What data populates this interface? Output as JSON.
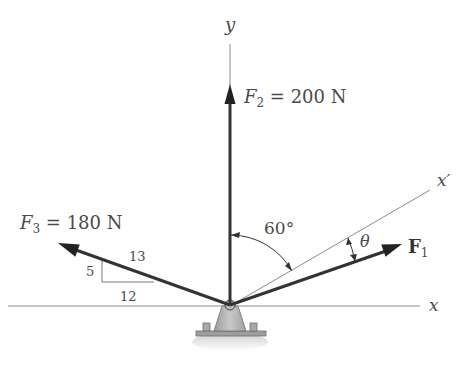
{
  "diagram": {
    "axes": {
      "y_label": "y",
      "x_label": "x",
      "x_prime_label": "x′"
    },
    "forces": [
      {
        "id": "F1",
        "symbol": "F",
        "subscript": "1",
        "label_suffix": "",
        "magnitude": "",
        "direction": "angle θ below x′ axis"
      },
      {
        "id": "F2",
        "symbol": "F",
        "subscript": "2",
        "label_suffix": " = 200 N",
        "magnitude": "200 N",
        "direction": "vertical up (+y)"
      },
      {
        "id": "F3",
        "symbol": "F",
        "subscript": "3",
        "label_suffix": " = 180 N",
        "magnitude": "180 N",
        "direction": "slope 5:12 (hyp 13), up-left"
      }
    ],
    "slope_triangle": {
      "hypotenuse": "13",
      "rise": "5",
      "run": "12"
    },
    "angles": {
      "y_to_xprime": "60°",
      "theta": "θ"
    },
    "colors": {
      "force_arrow": "#333333",
      "axis_line": "#8a8a8a",
      "support_fill": "#b5b5b5",
      "text": "#4a4a4a"
    }
  }
}
